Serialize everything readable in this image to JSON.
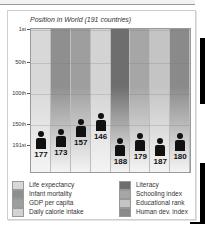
{
  "chart_data": {
    "type": "bar",
    "title": "Position in World (191 countries)",
    "xlabel": "",
    "ylabel": "",
    "ylim": [
      1,
      191
    ],
    "y_inverted": true,
    "y_ticks": [
      "1st",
      "50th",
      "100th",
      "150th",
      "191st"
    ],
    "grid": true,
    "legend_position": "bottom",
    "categories": [
      "Life expectancy",
      "Infant mortality",
      "GDP per capita",
      "Daily calorie intake",
      "Literacy",
      "Schooling index",
      "Educational rank",
      "Human dev. index"
    ],
    "values": [
      177,
      173,
      157,
      146,
      188,
      179,
      187,
      180
    ],
    "colors": [
      "#d8d8d8",
      "#8f8f8f",
      "#9e9e9e",
      "#d3d3d3",
      "#6e6e6e",
      "#a6a6a6",
      "#c4c4c4",
      "#8a8a8a"
    ]
  },
  "legend": {
    "left": [
      "Life expectancy",
      "Infant mortality",
      "GDP per capita",
      "Daily calorie intake"
    ],
    "right": [
      "Literacy",
      "Schooling index",
      "Educational rank",
      "Human dev. index"
    ]
  }
}
